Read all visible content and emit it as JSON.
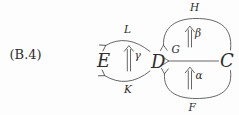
{
  "equation_label": "(B.4)",
  "colors": {
    "ink": "#4c4c4c",
    "text": "#2d2d2d",
    "background": "#fdfdfd"
  },
  "diagram": {
    "type": "commutative-diagram",
    "objects": {
      "E": {
        "label": "E",
        "style": "script-capital"
      },
      "D": {
        "label": "D",
        "style": "script-capital"
      },
      "C": {
        "label": "C",
        "style": "script-capital"
      }
    },
    "arrows": {
      "L": {
        "label": "L",
        "from": "D",
        "to": "E",
        "shape": "arc-above"
      },
      "K": {
        "label": "K",
        "from": "D",
        "to": "E",
        "shape": "arc-below"
      },
      "H": {
        "label": "H",
        "from": "C",
        "to": "D",
        "shape": "arc-above"
      },
      "G": {
        "label": "G",
        "from": "C",
        "to": "D",
        "shape": "straight"
      },
      "F": {
        "label": "F",
        "from": "C",
        "to": "D",
        "shape": "arc-below"
      }
    },
    "transformations": {
      "gamma": {
        "label": "γ",
        "between": "K and L",
        "direction": "up"
      },
      "beta": {
        "label": "β",
        "between": "G and H",
        "direction": "up"
      },
      "alpha": {
        "label": "α",
        "between": "F and G",
        "direction": "up"
      }
    }
  }
}
